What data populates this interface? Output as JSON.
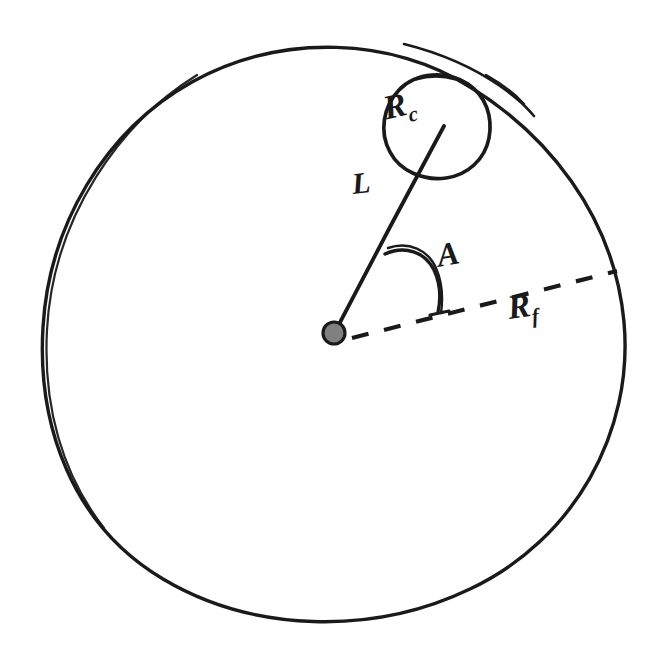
{
  "figure": {
    "background_color": "#ffffff",
    "ink_color": "#1a1a1a",
    "dot_fill_color": "#808080",
    "width": 665,
    "height": 659
  },
  "labels": {
    "outer_radius": {
      "base": "R",
      "sub": "f",
      "full": "Rf",
      "meaning": "radius of the large outer circle",
      "x": 508,
      "y": 287
    },
    "small_circle_radius": {
      "base": "R",
      "sub": "c",
      "full": "Rc",
      "meaning": "radius of the small circle",
      "x": 384,
      "y": 86
    },
    "arm_length": {
      "base": "L",
      "sub": "",
      "full": "L",
      "meaning": "length from center to small circle center",
      "x": 352,
      "y": 166
    },
    "angle": {
      "base": "A",
      "sub": "",
      "full": "A",
      "meaning": "angle between the L arm and the Rf dashed reference line",
      "x": 437,
      "y": 236
    }
  },
  "geometry": {
    "outer_circle": {
      "cx": 334,
      "cy": 333,
      "r": 292,
      "stroke_width": 3.4,
      "style": "solid"
    },
    "small_circle": {
      "cx": 438,
      "cy": 126,
      "r": 53,
      "stroke_width": 3.6,
      "style": "solid"
    },
    "center_dot": {
      "cx": 334,
      "cy": 333,
      "r": 11,
      "fill": "#808080",
      "stroke": "#1a1a1a"
    },
    "arm_line": {
      "x1": 334,
      "y1": 333,
      "x2": 444,
      "y2": 125,
      "stroke_width": 3.6,
      "style": "solid"
    },
    "reference_line": {
      "x1": 352,
      "y1": 337,
      "x2": 617,
      "y2": 271,
      "stroke_width": 4,
      "style": "dashed",
      "dash_pattern": "17 16"
    },
    "angle_arc": {
      "cx": 334,
      "cy": 333,
      "radius": 83,
      "start_deg": 62,
      "end_deg": 14,
      "stroke_width": 3.2
    }
  }
}
